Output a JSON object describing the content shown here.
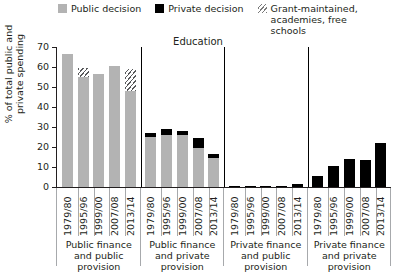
{
  "chart_data": {
    "type": "bar",
    "title": "Education",
    "xlabel": "",
    "ylabel": "% of total public and private spending",
    "ylim": [
      0,
      70
    ],
    "yticks": [
      0,
      10,
      20,
      30,
      40,
      50,
      60,
      70
    ],
    "grid": false,
    "legend_position": "top",
    "stacked": true,
    "categories": [
      "1979/80",
      "1995/96",
      "1999/00",
      "2007/08",
      "2013/14"
    ],
    "group_labels": [
      "Public finance and public provision",
      "Public finance and private provision",
      "Private finance and public provision",
      "Private finance and private provision"
    ],
    "series": [
      {
        "name": "Public decision",
        "color": "#b3b3b3"
      },
      {
        "name": "Private decision",
        "color": "#000000"
      },
      {
        "name": "Grant-maintained, academies, free schools",
        "color": "#ffffff"
      }
    ],
    "groups": [
      {
        "label": "Public finance and public provision",
        "bars": [
          {
            "category": "1979/80",
            "public": 66.5,
            "private": 0,
            "grant": 0
          },
          {
            "category": "1995/96",
            "public": 55.0,
            "private": 0,
            "grant": 4.5
          },
          {
            "category": "1999/00",
            "public": 56.5,
            "private": 0,
            "grant": 0
          },
          {
            "category": "2007/08",
            "public": 60.5,
            "private": 0,
            "grant": 0
          },
          {
            "category": "2013/14",
            "public": 48.0,
            "private": 0,
            "grant": 11.0
          }
        ]
      },
      {
        "label": "Public finance and private provision",
        "bars": [
          {
            "category": "1979/80",
            "public": 25.0,
            "private": 2.0,
            "grant": 0
          },
          {
            "category": "1995/96",
            "public": 26.0,
            "private": 3.0,
            "grant": 0
          },
          {
            "category": "1999/00",
            "public": 26.0,
            "private": 2.0,
            "grant": 0
          },
          {
            "category": "2007/08",
            "public": 19.5,
            "private": 5.0,
            "grant": 0
          },
          {
            "category": "2013/14",
            "public": 14.5,
            "private": 2.0,
            "grant": 0
          }
        ]
      },
      {
        "label": "Private finance and public provision",
        "bars": [
          {
            "category": "1979/80",
            "public": 0,
            "private": 0.2,
            "grant": 0
          },
          {
            "category": "1995/96",
            "public": 0,
            "private": 0.2,
            "grant": 0
          },
          {
            "category": "1999/00",
            "public": 0,
            "private": 0.2,
            "grant": 0
          },
          {
            "category": "2007/08",
            "public": 0,
            "private": 0.2,
            "grant": 0
          },
          {
            "category": "2013/14",
            "public": 0,
            "private": 1.3,
            "grant": 0
          }
        ]
      },
      {
        "label": "Private finance and private provision",
        "bars": [
          {
            "category": "1979/80",
            "public": 0,
            "private": 5.5,
            "grant": 0
          },
          {
            "category": "1995/96",
            "public": 0,
            "private": 10.5,
            "grant": 0
          },
          {
            "category": "1999/00",
            "public": 0,
            "private": 14.0,
            "grant": 0
          },
          {
            "category": "2007/08",
            "public": 0,
            "private": 13.5,
            "grant": 0
          },
          {
            "category": "2013/14",
            "public": 0,
            "private": 22.0,
            "grant": 0
          }
        ]
      }
    ]
  },
  "legend": {
    "items": [
      {
        "label": "Public decision",
        "swatch": "public-decision-swatch"
      },
      {
        "label": "Private decision",
        "swatch": "private-decision-swatch"
      },
      {
        "label": "Grant-maintained, academies, free schools",
        "swatch": "grant-maintained-swatch"
      }
    ]
  }
}
